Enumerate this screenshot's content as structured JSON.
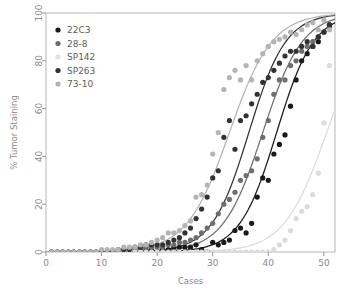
{
  "chart_data": {
    "type": "scatter",
    "title": "",
    "xlabel": "Cases",
    "ylabel": "% Tumor Staining",
    "xlim": [
      0,
      52
    ],
    "ylim": [
      0,
      100
    ],
    "xticks": [
      0,
      10,
      20,
      30,
      40,
      50
    ],
    "yticks": [
      0,
      20,
      40,
      60,
      80,
      100
    ],
    "grid": false,
    "legend_position": "top-left",
    "fit": "sigmoid",
    "series": [
      {
        "name": "22C3",
        "color": "#1a1a1a",
        "marker": "circle",
        "curve_midpoint": 41.5,
        "curve_steepness": 0.3,
        "points": [
          [
            1,
            0
          ],
          [
            2,
            0
          ],
          [
            3,
            0
          ],
          [
            4,
            0
          ],
          [
            5,
            0
          ],
          [
            6,
            0
          ],
          [
            7,
            0
          ],
          [
            8,
            0
          ],
          [
            9,
            0
          ],
          [
            10,
            0
          ],
          [
            11,
            0
          ],
          [
            12,
            0
          ],
          [
            13,
            0
          ],
          [
            14,
            0
          ],
          [
            15,
            0
          ],
          [
            16,
            0
          ],
          [
            17,
            1
          ],
          [
            18,
            1
          ],
          [
            19,
            1
          ],
          [
            20,
            0
          ],
          [
            21,
            1
          ],
          [
            22,
            1
          ],
          [
            23,
            2
          ],
          [
            24,
            2
          ],
          [
            25,
            2
          ],
          [
            26,
            2
          ],
          [
            27,
            3
          ],
          [
            28,
            1
          ],
          [
            29,
            0
          ],
          [
            30,
            4
          ],
          [
            31,
            3
          ],
          [
            32,
            4
          ],
          [
            33,
            5
          ],
          [
            34,
            9
          ],
          [
            35,
            10
          ],
          [
            36,
            8
          ],
          [
            37,
            12
          ],
          [
            38,
            23
          ],
          [
            39,
            31
          ],
          [
            40,
            30
          ],
          [
            41,
            41
          ],
          [
            42,
            45
          ],
          [
            43,
            49
          ],
          [
            44,
            61
          ],
          [
            45,
            72
          ],
          [
            46,
            80
          ],
          [
            47,
            83
          ],
          [
            48,
            86
          ],
          [
            49,
            88
          ],
          [
            50,
            92
          ],
          [
            51,
            95
          ]
        ]
      },
      {
        "name": "28-8",
        "color": "#6e6e6e",
        "marker": "circle",
        "curve_midpoint": 39.0,
        "curve_steepness": 0.28,
        "points": [
          [
            1,
            0
          ],
          [
            2,
            0
          ],
          [
            3,
            0
          ],
          [
            4,
            0
          ],
          [
            5,
            0
          ],
          [
            6,
            0
          ],
          [
            7,
            0
          ],
          [
            8,
            0
          ],
          [
            9,
            0
          ],
          [
            10,
            0
          ],
          [
            11,
            0
          ],
          [
            12,
            0
          ],
          [
            13,
            0
          ],
          [
            14,
            1
          ],
          [
            15,
            1
          ],
          [
            16,
            1
          ],
          [
            17,
            1
          ],
          [
            18,
            2
          ],
          [
            19,
            2
          ],
          [
            20,
            2
          ],
          [
            21,
            2
          ],
          [
            22,
            3
          ],
          [
            23,
            3
          ],
          [
            24,
            4
          ],
          [
            25,
            4
          ],
          [
            26,
            5
          ],
          [
            27,
            6
          ],
          [
            28,
            8
          ],
          [
            29,
            10
          ],
          [
            30,
            12
          ],
          [
            31,
            16
          ],
          [
            32,
            20
          ],
          [
            33,
            22
          ],
          [
            34,
            25
          ],
          [
            35,
            30
          ],
          [
            36,
            32
          ],
          [
            37,
            34
          ],
          [
            38,
            39
          ],
          [
            39,
            48
          ],
          [
            40,
            55
          ],
          [
            41,
            66
          ],
          [
            42,
            72
          ],
          [
            43,
            72
          ],
          [
            44,
            78
          ],
          [
            45,
            80
          ],
          [
            46,
            84
          ],
          [
            47,
            86
          ],
          [
            48,
            88
          ],
          [
            49,
            90
          ],
          [
            50,
            92
          ],
          [
            51,
            94
          ]
        ]
      },
      {
        "name": "SP142",
        "color": "#dcdcdc",
        "marker": "circle",
        "curve_midpoint": 50.5,
        "curve_steepness": 0.26,
        "points": [
          [
            1,
            0
          ],
          [
            2,
            0
          ],
          [
            3,
            0
          ],
          [
            4,
            0
          ],
          [
            5,
            0
          ],
          [
            6,
            0
          ],
          [
            7,
            0
          ],
          [
            8,
            0
          ],
          [
            9,
            0
          ],
          [
            10,
            0
          ],
          [
            11,
            0
          ],
          [
            12,
            0
          ],
          [
            13,
            0
          ],
          [
            14,
            0
          ],
          [
            15,
            0
          ],
          [
            16,
            0
          ],
          [
            17,
            0
          ],
          [
            18,
            0
          ],
          [
            19,
            0
          ],
          [
            20,
            0
          ],
          [
            21,
            0
          ],
          [
            22,
            0
          ],
          [
            23,
            0
          ],
          [
            24,
            0
          ],
          [
            25,
            0
          ],
          [
            26,
            0
          ],
          [
            27,
            0
          ],
          [
            28,
            0
          ],
          [
            29,
            0
          ],
          [
            30,
            0
          ],
          [
            31,
            0
          ],
          [
            32,
            0
          ],
          [
            33,
            0
          ],
          [
            34,
            0
          ],
          [
            35,
            0
          ],
          [
            36,
            0
          ],
          [
            37,
            0
          ],
          [
            38,
            0
          ],
          [
            39,
            0
          ],
          [
            40,
            0
          ],
          [
            41,
            1
          ],
          [
            42,
            3
          ],
          [
            43,
            5
          ],
          [
            44,
            9
          ],
          [
            45,
            14
          ],
          [
            46,
            17
          ],
          [
            47,
            19
          ],
          [
            48,
            24
          ],
          [
            49,
            33
          ],
          [
            50,
            54
          ],
          [
            51,
            78
          ]
        ]
      },
      {
        "name": "SP263",
        "color": "#333333",
        "marker": "circle",
        "curve_midpoint": 36.5,
        "curve_steepness": 0.3,
        "points": [
          [
            1,
            0
          ],
          [
            2,
            0
          ],
          [
            3,
            0
          ],
          [
            4,
            0
          ],
          [
            5,
            0
          ],
          [
            6,
            0
          ],
          [
            7,
            0
          ],
          [
            8,
            0
          ],
          [
            9,
            0
          ],
          [
            10,
            0
          ],
          [
            11,
            0
          ],
          [
            12,
            0
          ],
          [
            13,
            1
          ],
          [
            14,
            1
          ],
          [
            15,
            1
          ],
          [
            16,
            2
          ],
          [
            17,
            2
          ],
          [
            18,
            3
          ],
          [
            19,
            3
          ],
          [
            20,
            3
          ],
          [
            21,
            3
          ],
          [
            22,
            4
          ],
          [
            23,
            5
          ],
          [
            24,
            6
          ],
          [
            25,
            8
          ],
          [
            26,
            10
          ],
          [
            27,
            14
          ],
          [
            28,
            18
          ],
          [
            29,
            23
          ],
          [
            30,
            31
          ],
          [
            31,
            34
          ],
          [
            32,
            48
          ],
          [
            33,
            55
          ],
          [
            34,
            43
          ],
          [
            35,
            55
          ],
          [
            36,
            57
          ],
          [
            37,
            62
          ],
          [
            38,
            66
          ],
          [
            39,
            71
          ],
          [
            40,
            73
          ],
          [
            41,
            76
          ],
          [
            42,
            79
          ],
          [
            43,
            82
          ],
          [
            44,
            84
          ],
          [
            45,
            84
          ],
          [
            46,
            86
          ],
          [
            47,
            88
          ],
          [
            48,
            86
          ],
          [
            49,
            90
          ],
          [
            50,
            92
          ],
          [
            51,
            95
          ]
        ]
      },
      {
        "name": "73-10",
        "color": "#b4b4b4",
        "marker": "circle",
        "curve_midpoint": 33.0,
        "curve_steepness": 0.26,
        "points": [
          [
            1,
            0
          ],
          [
            2,
            0
          ],
          [
            3,
            0
          ],
          [
            4,
            0
          ],
          [
            5,
            0
          ],
          [
            6,
            0
          ],
          [
            7,
            0
          ],
          [
            8,
            0
          ],
          [
            9,
            0
          ],
          [
            10,
            1
          ],
          [
            11,
            1
          ],
          [
            12,
            1
          ],
          [
            13,
            1
          ],
          [
            14,
            2
          ],
          [
            15,
            2
          ],
          [
            16,
            2
          ],
          [
            17,
            3
          ],
          [
            18,
            3
          ],
          [
            19,
            4
          ],
          [
            20,
            5
          ],
          [
            21,
            6
          ],
          [
            22,
            8
          ],
          [
            23,
            8
          ],
          [
            24,
            9
          ],
          [
            25,
            11
          ],
          [
            26,
            13
          ],
          [
            27,
            23
          ],
          [
            28,
            24
          ],
          [
            29,
            28
          ],
          [
            30,
            41
          ],
          [
            31,
            50
          ],
          [
            32,
            68
          ],
          [
            33,
            73
          ],
          [
            34,
            76
          ],
          [
            35,
            72
          ],
          [
            36,
            78
          ],
          [
            37,
            72
          ],
          [
            38,
            80
          ],
          [
            39,
            83
          ],
          [
            40,
            86
          ],
          [
            41,
            88
          ],
          [
            42,
            89
          ],
          [
            43,
            90
          ],
          [
            44,
            92
          ],
          [
            45,
            91
          ],
          [
            46,
            93
          ],
          [
            47,
            95
          ],
          [
            48,
            96
          ],
          [
            49,
            93
          ],
          [
            50,
            97
          ],
          [
            51,
            93
          ]
        ]
      }
    ]
  },
  "legend": {
    "items": [
      {
        "label": "22C3",
        "color": "#1a1a1a"
      },
      {
        "label": "28-8",
        "color": "#6e6e6e"
      },
      {
        "label": "SP142",
        "color": "#e2e2e2"
      },
      {
        "label": "SP263",
        "color": "#333333"
      },
      {
        "label": "73-10",
        "color": "#b4b4b4"
      }
    ]
  },
  "axes": {
    "x_title": "Cases",
    "y_title": "% Tumor Staining",
    "x_tick_labels": [
      "0",
      "10",
      "20",
      "30",
      "40",
      "50"
    ],
    "y_tick_labels": [
      "0",
      "20",
      "40",
      "60",
      "80",
      "100"
    ],
    "frame_color": "#b0b0b0",
    "tick_color": "#8a8a8a"
  }
}
